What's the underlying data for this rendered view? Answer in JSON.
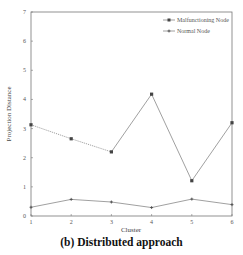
{
  "chart_data": {
    "type": "line",
    "title": "",
    "caption": "(b) Distributed approach",
    "xlabel": "Cluster",
    "ylabel": "Projection Distance",
    "x": [
      1,
      2,
      3,
      4,
      5,
      6
    ],
    "xticks": [
      "1",
      "2",
      "3",
      "4",
      "5",
      "6"
    ],
    "yticks": [
      "0",
      "1",
      "2",
      "3",
      "4",
      "5",
      "6",
      "7"
    ],
    "ylim": [
      0,
      7
    ],
    "xlim": [
      1,
      6
    ],
    "grid": false,
    "legend_position": "upper right",
    "series": [
      {
        "name": "Malfunctioning Node",
        "values": [
          3.13,
          2.65,
          2.2,
          4.18,
          1.21,
          3.2
        ],
        "marker": "square",
        "color": "#888888",
        "note": "segment 1-3 dotted"
      },
      {
        "name": "Normal Node",
        "values": [
          0.3,
          0.57,
          0.48,
          0.29,
          0.58,
          0.39
        ],
        "marker": "plus",
        "color": "#888888"
      }
    ]
  }
}
